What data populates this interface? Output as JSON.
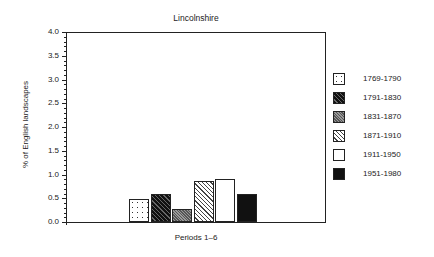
{
  "chart_data": {
    "type": "bar",
    "title": "Lincolnshire",
    "xlabel": "Periods 1–6",
    "ylabel": "% of English landscapes",
    "ylim": [
      0,
      4.0
    ],
    "yticks": [
      "0.0",
      "0.5",
      "1.0",
      "1.5",
      "2.0",
      "2.5",
      "3.0",
      "3.5",
      "4.0"
    ],
    "grid": false,
    "legend_position": "right",
    "categories": [
      "1769-1790",
      "1791-1830",
      "1831-1870",
      "1871-1910",
      "1911-1950",
      "1951-1980"
    ],
    "values": [
      0.48,
      0.6,
      0.27,
      0.87,
      0.9,
      0.6
    ]
  },
  "legend": [
    {
      "label": "1769-1790",
      "pattern": "p-dots"
    },
    {
      "label": "1791-1830",
      "pattern": "p-darkhatch"
    },
    {
      "label": "1831-1870",
      "pattern": "p-cross"
    },
    {
      "label": "1871-1910",
      "pattern": "p-lighthatch"
    },
    {
      "label": "1911-1950",
      "pattern": "p-white"
    },
    {
      "label": "1951-1980",
      "pattern": "p-black"
    }
  ]
}
